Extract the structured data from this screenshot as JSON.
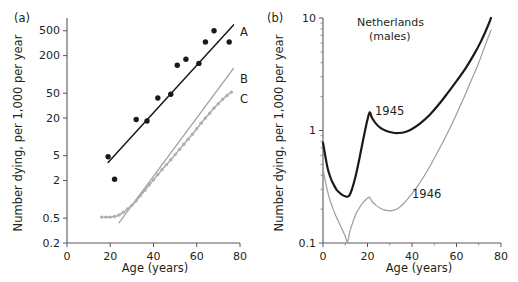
{
  "figure": {
    "panels": [
      {
        "id": "a",
        "label": "(a)",
        "xlabel": "Age (years)",
        "ylabel": "Number dying, per 1,000 per year"
      },
      {
        "id": "b",
        "label": "(b)",
        "xlabel": "Age (years)",
        "ylabel": "Number dying, per 1,000 per year",
        "annotation_line1": "Netherlands",
        "annotation_line2": "(males)"
      }
    ]
  },
  "chart_data": [
    {
      "type": "scatter",
      "panel": "a",
      "title": "",
      "xlabel": "Age (years)",
      "ylabel": "Number dying, per 1,000 per year",
      "xlim": [
        0,
        80
      ],
      "ylim": [
        0.2,
        800
      ],
      "yscale": "log",
      "xticks": [
        0,
        20,
        40,
        60,
        80
      ],
      "xtick_labels": [
        "0",
        "20",
        "40",
        "60",
        "80"
      ],
      "yticks": [
        0.2,
        0.5,
        2,
        5,
        20,
        50,
        200,
        500
      ],
      "ytick_labels": [
        "0.2",
        "0.5",
        "2",
        "5",
        "20",
        "50",
        "200",
        "500"
      ],
      "grid": false,
      "legend": "inline-curve-labels",
      "series": [
        {
          "name": "A",
          "label": "A",
          "color": "#1a1a1a",
          "style": "points-with-fit-line",
          "points": [
            {
              "x": 19,
              "y": 4.8
            },
            {
              "x": 22,
              "y": 2.1
            },
            {
              "x": 32,
              "y": 19
            },
            {
              "x": 37,
              "y": 18
            },
            {
              "x": 42,
              "y": 42
            },
            {
              "x": 48,
              "y": 48
            },
            {
              "x": 51,
              "y": 140
            },
            {
              "x": 55,
              "y": 175
            },
            {
              "x": 61,
              "y": 150
            },
            {
              "x": 64,
              "y": 330
            },
            {
              "x": 68,
              "y": 500
            },
            {
              "x": 75,
              "y": 330
            }
          ],
          "fit_line": [
            {
              "x": 19,
              "y": 3.9
            },
            {
              "x": 77,
              "y": 620
            }
          ]
        },
        {
          "name": "B",
          "label": "B",
          "color": "#9d9d9d",
          "style": "line",
          "points": [
            {
              "x": 24,
              "y": 0.42
            },
            {
              "x": 77,
              "y": 125
            }
          ]
        },
        {
          "name": "C",
          "label": "C",
          "color": "#b0b0b0",
          "style": "dotted-curve",
          "points": [
            {
              "x": 16,
              "y": 0.52
            },
            {
              "x": 18,
              "y": 0.52
            },
            {
              "x": 20,
              "y": 0.52
            },
            {
              "x": 22,
              "y": 0.53
            },
            {
              "x": 24,
              "y": 0.56
            },
            {
              "x": 26,
              "y": 0.62
            },
            {
              "x": 28,
              "y": 0.7
            },
            {
              "x": 30,
              "y": 0.8
            },
            {
              "x": 32,
              "y": 0.95
            },
            {
              "x": 34,
              "y": 1.15
            },
            {
              "x": 36,
              "y": 1.4
            },
            {
              "x": 38,
              "y": 1.7
            },
            {
              "x": 40,
              "y": 2.05
            },
            {
              "x": 42,
              "y": 2.5
            },
            {
              "x": 44,
              "y": 3.0
            },
            {
              "x": 46,
              "y": 3.6
            },
            {
              "x": 48,
              "y": 4.3
            },
            {
              "x": 50,
              "y": 5.2
            },
            {
              "x": 52,
              "y": 6.3
            },
            {
              "x": 54,
              "y": 7.6
            },
            {
              "x": 56,
              "y": 9.2
            },
            {
              "x": 58,
              "y": 11
            },
            {
              "x": 60,
              "y": 13.5
            },
            {
              "x": 62,
              "y": 16.5
            },
            {
              "x": 64,
              "y": 20
            },
            {
              "x": 66,
              "y": 24
            },
            {
              "x": 68,
              "y": 29
            },
            {
              "x": 70,
              "y": 34
            },
            {
              "x": 72,
              "y": 40
            },
            {
              "x": 74,
              "y": 46
            },
            {
              "x": 76,
              "y": 52
            }
          ]
        }
      ]
    },
    {
      "type": "line",
      "panel": "b",
      "title": "Netherlands (males)",
      "xlabel": "Age (years)",
      "ylabel": "Number dying, per 1,000 per year",
      "xlim": [
        0,
        80
      ],
      "ylim": [
        0.1,
        10
      ],
      "yscale": "log",
      "xticks": [
        0,
        20,
        40,
        60,
        80
      ],
      "xtick_labels": [
        "0",
        "20",
        "40",
        "60",
        "80"
      ],
      "yticks": [
        0.1,
        1,
        10
      ],
      "ytick_labels": [
        "0.1",
        "1",
        "10"
      ],
      "grid": false,
      "legend": "inline-curve-labels",
      "series": [
        {
          "name": "1945",
          "label": "1945",
          "color": "#1a1a1a",
          "width": "thick",
          "points": [
            {
              "x": 0,
              "y": 0.78
            },
            {
              "x": 1,
              "y": 0.6
            },
            {
              "x": 2,
              "y": 0.47
            },
            {
              "x": 3,
              "y": 0.4
            },
            {
              "x": 4,
              "y": 0.355
            },
            {
              "x": 5,
              "y": 0.325
            },
            {
              "x": 6,
              "y": 0.3
            },
            {
              "x": 7,
              "y": 0.285
            },
            {
              "x": 8,
              "y": 0.273
            },
            {
              "x": 9,
              "y": 0.265
            },
            {
              "x": 10,
              "y": 0.26
            },
            {
              "x": 11,
              "y": 0.258
            },
            {
              "x": 12,
              "y": 0.268
            },
            {
              "x": 13,
              "y": 0.3
            },
            {
              "x": 14,
              "y": 0.35
            },
            {
              "x": 15,
              "y": 0.42
            },
            {
              "x": 16,
              "y": 0.52
            },
            {
              "x": 17,
              "y": 0.65
            },
            {
              "x": 18,
              "y": 0.82
            },
            {
              "x": 19,
              "y": 1.02
            },
            {
              "x": 20,
              "y": 1.25
            },
            {
              "x": 21,
              "y": 1.45
            },
            {
              "x": 22,
              "y": 1.3
            },
            {
              "x": 24,
              "y": 1.14
            },
            {
              "x": 26,
              "y": 1.05
            },
            {
              "x": 28,
              "y": 1.0
            },
            {
              "x": 31,
              "y": 0.96
            },
            {
              "x": 34,
              "y": 0.95
            },
            {
              "x": 37,
              "y": 0.97
            },
            {
              "x": 40,
              "y": 1.03
            },
            {
              "x": 44,
              "y": 1.17
            },
            {
              "x": 48,
              "y": 1.38
            },
            {
              "x": 52,
              "y": 1.7
            },
            {
              "x": 56,
              "y": 2.15
            },
            {
              "x": 60,
              "y": 2.75
            },
            {
              "x": 64,
              "y": 3.55
            },
            {
              "x": 68,
              "y": 4.8
            },
            {
              "x": 71,
              "y": 6.2
            },
            {
              "x": 74,
              "y": 8.4
            },
            {
              "x": 75.5,
              "y": 10.0
            }
          ]
        },
        {
          "name": "1946",
          "label": "1946",
          "color": "#9d9d9d",
          "width": "normal",
          "points": [
            {
              "x": 0,
              "y": 0.46
            },
            {
              "x": 1,
              "y": 0.36
            },
            {
              "x": 2,
              "y": 0.29
            },
            {
              "x": 3,
              "y": 0.245
            },
            {
              "x": 4,
              "y": 0.215
            },
            {
              "x": 5,
              "y": 0.19
            },
            {
              "x": 6,
              "y": 0.17
            },
            {
              "x": 7,
              "y": 0.155
            },
            {
              "x": 8,
              "y": 0.14
            },
            {
              "x": 9,
              "y": 0.127
            },
            {
              "x": 10,
              "y": 0.115
            },
            {
              "x": 11,
              "y": 0.102
            },
            {
              "x": 12,
              "y": 0.125
            },
            {
              "x": 13,
              "y": 0.145
            },
            {
              "x": 14,
              "y": 0.165
            },
            {
              "x": 15,
              "y": 0.185
            },
            {
              "x": 16,
              "y": 0.2
            },
            {
              "x": 17,
              "y": 0.215
            },
            {
              "x": 18,
              "y": 0.228
            },
            {
              "x": 19,
              "y": 0.24
            },
            {
              "x": 20,
              "y": 0.25
            },
            {
              "x": 21,
              "y": 0.255
            },
            {
              "x": 22,
              "y": 0.235
            },
            {
              "x": 24,
              "y": 0.215
            },
            {
              "x": 26,
              "y": 0.203
            },
            {
              "x": 28,
              "y": 0.196
            },
            {
              "x": 30,
              "y": 0.193
            },
            {
              "x": 32,
              "y": 0.196
            },
            {
              "x": 34,
              "y": 0.205
            },
            {
              "x": 36,
              "y": 0.222
            },
            {
              "x": 38,
              "y": 0.245
            },
            {
              "x": 40,
              "y": 0.275
            },
            {
              "x": 43,
              "y": 0.33
            },
            {
              "x": 46,
              "y": 0.41
            },
            {
              "x": 49,
              "y": 0.52
            },
            {
              "x": 52,
              "y": 0.67
            },
            {
              "x": 55,
              "y": 0.87
            },
            {
              "x": 58,
              "y": 1.15
            },
            {
              "x": 61,
              "y": 1.55
            },
            {
              "x": 64,
              "y": 2.1
            },
            {
              "x": 67,
              "y": 2.9
            },
            {
              "x": 70,
              "y": 4.0
            },
            {
              "x": 73,
              "y": 5.8
            },
            {
              "x": 75.5,
              "y": 7.8
            }
          ]
        }
      ]
    }
  ]
}
